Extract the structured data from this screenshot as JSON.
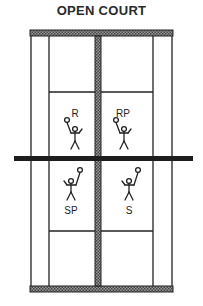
{
  "title": "OPEN COURT",
  "court": {
    "players": [
      {
        "label": "R",
        "position": "upper-left"
      },
      {
        "label": "RP",
        "position": "upper-right"
      },
      {
        "label": "SP",
        "position": "lower-left"
      },
      {
        "label": "S",
        "position": "lower-right"
      }
    ]
  },
  "colors": {
    "line": "#222222",
    "hatch": "#888888",
    "background": "#ffffff"
  }
}
